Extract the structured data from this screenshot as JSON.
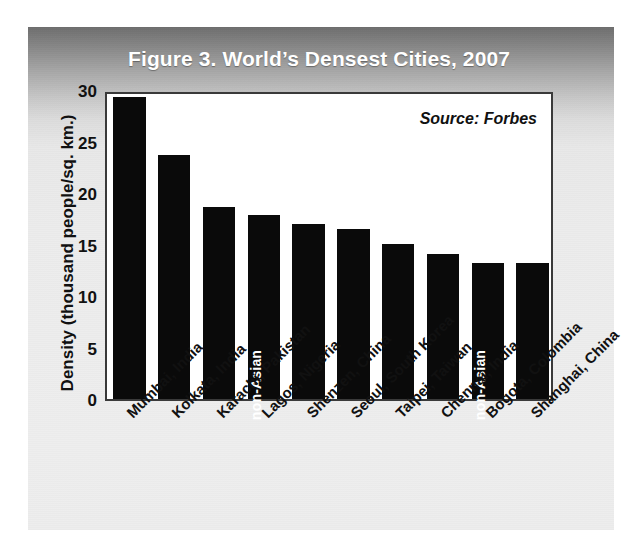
{
  "figure": {
    "title": "Figure 3. World’s Densest Cities, 2007",
    "source_note": "Source: Forbes",
    "y_axis_title": "Density (thousand people/sq. km.)"
  },
  "colors": {
    "bar": "#0a0a0a",
    "panel_top": "#6e6e6e",
    "panel_bottom": "#ededed",
    "plot_bg": "#ffffff",
    "frame": "#3a3a3a",
    "title_text": "#ffffff",
    "axis_text": "#111111",
    "bar_note_text": "#ffffff"
  },
  "axis": {
    "y_ticks": [
      "0",
      "5",
      "10",
      "15",
      "20",
      "25",
      "30"
    ],
    "y_min": 0,
    "y_max": 30
  },
  "bar_notes": {
    "lagos": "non-Asian",
    "bogota": "non-Asian"
  },
  "chart_data": {
    "type": "bar",
    "title": "Figure 3. World’s Densest Cities, 2007",
    "xlabel": "",
    "ylabel": "Density (thousand people/sq. km.)",
    "ylim": [
      0,
      30
    ],
    "ytick_step": 5,
    "grid": false,
    "legend": null,
    "annotations": [
      "Source: Forbes",
      "non-Asian (Lagos, Nigeria)",
      "non-Asian (Bogota, Colombia)"
    ],
    "categories": [
      "Mumbai, India",
      "Kolkata, India",
      "Karachi, Pakistan",
      "Lagos, Nigeria",
      "Shenzen, China",
      "Seoul, South Korea",
      "Taipei, Taiwan",
      "Chennai, India",
      "Bogota, Colombia",
      "Shanghai, China"
    ],
    "values": [
      29.7,
      24.0,
      18.9,
      18.1,
      17.2,
      16.7,
      15.2,
      14.3,
      13.4,
      13.4
    ],
    "unit": "thousand people per sq. km."
  }
}
